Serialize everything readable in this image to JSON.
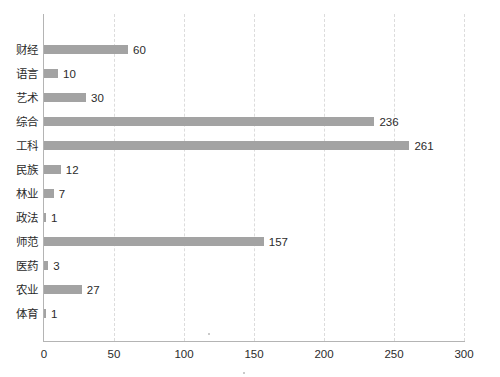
{
  "chart_data": {
    "type": "bar",
    "orientation": "horizontal",
    "title": "",
    "xlabel": "",
    "ylabel": "",
    "categories": [
      "财经",
      "语言",
      "艺术",
      "综合",
      "工科",
      "民族",
      "林业",
      "政法",
      "师范",
      "医药",
      "农业",
      "体育"
    ],
    "values": [
      60,
      10,
      30,
      236,
      261,
      12,
      7,
      1,
      157,
      3,
      27,
      1
    ],
    "value_labels": [
      "60",
      "10",
      "30",
      "236",
      "261",
      "12",
      "7",
      "1",
      "157",
      "3",
      "27",
      "1"
    ],
    "xlim": [
      0,
      300
    ],
    "xticks": [
      0,
      50,
      100,
      150,
      200,
      250,
      300
    ],
    "xtick_labels": [
      "0",
      "50",
      "100",
      "150",
      "200",
      "250",
      "300"
    ],
    "grid": "vertical-dashed",
    "legend": "none",
    "bar_color": "#a3a3a3",
    "axis_color": "#b4b4b4",
    "gridline_color": "#dcdcdc",
    "text_color": "#2b2b2b"
  }
}
